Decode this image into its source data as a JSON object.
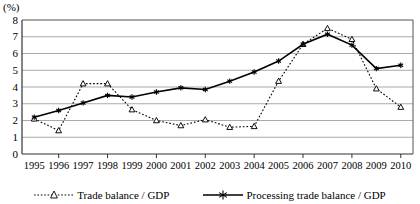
{
  "chart_data": {
    "type": "line",
    "title": "",
    "xlabel": "",
    "ylabel": "(%)",
    "unit_label": "(%)",
    "ylim": [
      0,
      8
    ],
    "yticks": [
      0,
      1,
      2,
      3,
      4,
      5,
      6,
      7,
      8
    ],
    "ytick_labels": [
      "0",
      "1",
      "2",
      "3",
      "4",
      "5",
      "6",
      "7",
      "8"
    ],
    "grid": true,
    "legend_position": "bottom",
    "categories": [
      "1995",
      "1996",
      "1997",
      "1998",
      "1999",
      "2000",
      "2001",
      "2002",
      "2003",
      "2004",
      "2005",
      "2006",
      "2007",
      "2008",
      "2009",
      "2010"
    ],
    "series": [
      {
        "name": "Trade balance / GDP",
        "marker": "triangle-open",
        "line_style": "dotted",
        "color": "#000000",
        "values": [
          2.1,
          1.4,
          4.2,
          4.2,
          2.65,
          2.0,
          1.7,
          2.05,
          1.6,
          1.65,
          4.35,
          6.55,
          7.5,
          6.85,
          3.9,
          2.8
        ]
      },
      {
        "name": "Processing trade balance / GDP",
        "marker": "star",
        "line_style": "solid",
        "color": "#000000",
        "values": [
          2.2,
          2.6,
          3.05,
          3.5,
          3.4,
          3.7,
          3.95,
          3.85,
          4.35,
          4.9,
          5.55,
          6.55,
          7.15,
          6.5,
          5.1,
          5.3
        ]
      }
    ]
  },
  "legend": {
    "items": [
      {
        "label": "Trade balance / GDP",
        "marker": "triangle-open-icon",
        "style": "dotted"
      },
      {
        "label": "Processing trade balance / GDP",
        "marker": "star-icon",
        "style": "solid"
      }
    ]
  }
}
